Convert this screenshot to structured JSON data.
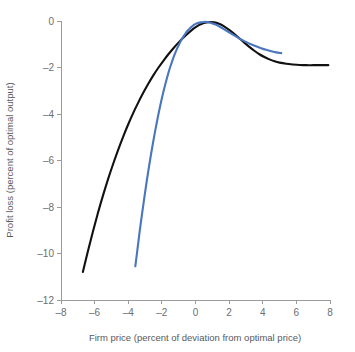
{
  "chart_data": {
    "type": "line",
    "title": "",
    "subtitle": "",
    "xlabel": "Firm price (percent of deviation from optimal price)",
    "ylabel": "Profit loss (percent of optimal output)",
    "xlim": [
      -8,
      8
    ],
    "ylim": [
      -12,
      0
    ],
    "xticks": [
      -8,
      -6,
      -4,
      -2,
      0,
      2,
      4,
      6,
      8
    ],
    "xtick_labels": [
      "–8",
      "–6",
      "–4",
      "–2",
      "0",
      "2",
      "4",
      "6",
      "8"
    ],
    "yticks": [
      0,
      -2,
      -4,
      -6,
      -8,
      -10,
      -12
    ],
    "ytick_labels": [
      "0",
      "–2",
      "–4",
      "–6",
      "–8",
      "–10",
      "–12"
    ],
    "grid": false,
    "legend": null,
    "legend_position": "none",
    "annotations": [],
    "series": [
      {
        "name": "black-curve",
        "color": "#111111",
        "width": 2.1,
        "points": [
          [
            -6.7,
            -10.8
          ],
          [
            -6.4,
            -9.9
          ],
          [
            -6.1,
            -9.05
          ],
          [
            -5.8,
            -8.25
          ],
          [
            -5.5,
            -7.5
          ],
          [
            -5.2,
            -6.8
          ],
          [
            -4.9,
            -6.15
          ],
          [
            -4.6,
            -5.54
          ],
          [
            -4.3,
            -4.97
          ],
          [
            -4.0,
            -4.44
          ],
          [
            -3.7,
            -3.95
          ],
          [
            -3.4,
            -3.5
          ],
          [
            -3.1,
            -3.08
          ],
          [
            -2.8,
            -2.69
          ],
          [
            -2.5,
            -2.33
          ],
          [
            -2.2,
            -2.0
          ],
          [
            -1.9,
            -1.7
          ],
          [
            -1.6,
            -1.42
          ],
          [
            -1.3,
            -1.16
          ],
          [
            -1.0,
            -0.92
          ],
          [
            -0.7,
            -0.7
          ],
          [
            -0.4,
            -0.5
          ],
          [
            -0.1,
            -0.32
          ],
          [
            0.2,
            -0.18
          ],
          [
            0.5,
            -0.09
          ],
          [
            0.8,
            -0.05
          ],
          [
            1.1,
            -0.06
          ],
          [
            1.4,
            -0.12
          ],
          [
            1.7,
            -0.23
          ],
          [
            2.0,
            -0.38
          ],
          [
            2.3,
            -0.55
          ],
          [
            2.6,
            -0.74
          ],
          [
            2.9,
            -0.93
          ],
          [
            3.2,
            -1.11
          ],
          [
            3.5,
            -1.28
          ],
          [
            3.8,
            -1.43
          ],
          [
            4.1,
            -1.55
          ],
          [
            4.4,
            -1.65
          ],
          [
            4.7,
            -1.73
          ],
          [
            5.0,
            -1.79
          ],
          [
            5.4,
            -1.84
          ],
          [
            5.8,
            -1.87
          ],
          [
            6.2,
            -1.89
          ],
          [
            6.6,
            -1.9
          ],
          [
            7.0,
            -1.9
          ],
          [
            7.4,
            -1.9
          ],
          [
            7.9,
            -1.9
          ]
        ]
      },
      {
        "name": "blue-curve",
        "color": "#4a76bd",
        "width": 2.1,
        "points": [
          [
            -3.58,
            -10.55
          ],
          [
            -3.45,
            -9.8
          ],
          [
            -3.32,
            -9.05
          ],
          [
            -3.19,
            -8.35
          ],
          [
            -3.06,
            -7.68
          ],
          [
            -2.93,
            -7.03
          ],
          [
            -2.8,
            -6.42
          ],
          [
            -2.67,
            -5.84
          ],
          [
            -2.54,
            -5.29
          ],
          [
            -2.41,
            -4.77
          ],
          [
            -2.28,
            -4.28
          ],
          [
            -2.15,
            -3.82
          ],
          [
            -2.02,
            -3.39
          ],
          [
            -1.89,
            -2.99
          ],
          [
            -1.76,
            -2.62
          ],
          [
            -1.63,
            -2.28
          ],
          [
            -1.5,
            -1.97
          ],
          [
            -1.37,
            -1.69
          ],
          [
            -1.24,
            -1.44
          ],
          [
            -1.11,
            -1.21
          ],
          [
            -0.98,
            -1.01
          ],
          [
            -0.85,
            -0.83
          ],
          [
            -0.72,
            -0.67
          ],
          [
            -0.59,
            -0.53
          ],
          [
            -0.46,
            -0.41
          ],
          [
            -0.33,
            -0.31
          ],
          [
            -0.2,
            -0.23
          ],
          [
            -0.07,
            -0.16
          ],
          [
            0.1,
            -0.1
          ],
          [
            0.3,
            -0.06
          ],
          [
            0.5,
            -0.04
          ],
          [
            0.7,
            -0.04
          ],
          [
            0.9,
            -0.07
          ],
          [
            1.2,
            -0.15
          ],
          [
            1.5,
            -0.27
          ],
          [
            1.8,
            -0.4
          ],
          [
            2.1,
            -0.53
          ],
          [
            2.4,
            -0.66
          ],
          [
            2.7,
            -0.79
          ],
          [
            3.0,
            -0.9
          ],
          [
            3.3,
            -1.0
          ],
          [
            3.6,
            -1.09
          ],
          [
            3.9,
            -1.17
          ],
          [
            4.2,
            -1.24
          ],
          [
            4.5,
            -1.3
          ],
          [
            4.8,
            -1.35
          ],
          [
            5.1,
            -1.38
          ]
        ]
      }
    ]
  }
}
